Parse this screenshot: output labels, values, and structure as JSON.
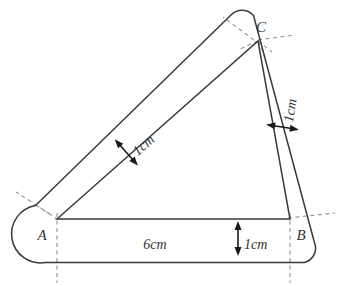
{
  "figure": {
    "background_color": "#ffffff",
    "stroke_color": "#3a3a3a",
    "dashed_color": "#9a9a9a",
    "arrow_color": "#1a1a1a",
    "vertices": [
      {
        "id": "A",
        "label": "A",
        "x": 46,
        "y": 235
      },
      {
        "id": "B",
        "label": "B",
        "x": 300,
        "y": 235
      },
      {
        "id": "C",
        "label": "C",
        "x": 258,
        "y": 33
      }
    ],
    "dimensions": [
      {
        "id": "base-length",
        "label": "6cm",
        "x": 155,
        "y": 245,
        "rotation": 0
      },
      {
        "id": "base-thickness",
        "label": "1cm",
        "x": 252,
        "y": 245,
        "rotation": 0
      },
      {
        "id": "left-arm-thickness",
        "label": "1cm",
        "x": 133,
        "y": 148,
        "rotation": 51
      },
      {
        "id": "right-arm-thickness",
        "label": "1cm",
        "x": 279,
        "y": 140,
        "rotation": 79
      }
    ]
  }
}
